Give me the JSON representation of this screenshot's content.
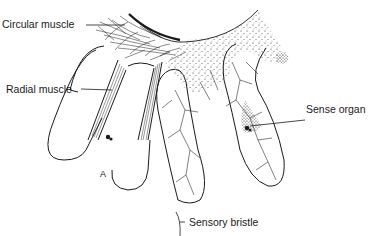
{
  "figure": {
    "panel_letter": "A",
    "labels": {
      "circular_muscle": "Circular muscle",
      "radial_muscle": "Radial muscle",
      "sense_organ": "Sense organ",
      "sensory_bristle": "Sensory bristle"
    },
    "colors": {
      "ink": "#1a1a1a",
      "background": "#ffffff"
    }
  }
}
